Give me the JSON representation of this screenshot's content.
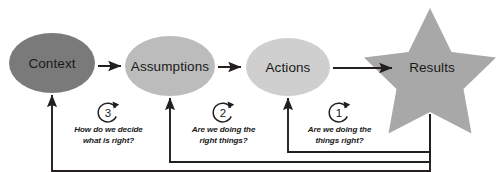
{
  "diagram": {
    "nodes": [
      {
        "id": "context",
        "label": "Context",
        "shape": "ellipse",
        "fill": "#7a7a7a"
      },
      {
        "id": "assumptions",
        "label": "Assumptions",
        "shape": "ellipse",
        "fill": "#bcbcbc"
      },
      {
        "id": "actions",
        "label": "Actions",
        "shape": "ellipse",
        "fill": "#cfcfcf"
      },
      {
        "id": "results",
        "label": "Results",
        "shape": "star",
        "fill": "#a8a8a8"
      }
    ],
    "flow_arrows": [
      {
        "from": "context",
        "to": "assumptions"
      },
      {
        "from": "assumptions",
        "to": "actions"
      },
      {
        "from": "actions",
        "to": "results"
      }
    ],
    "feedback_loops": [
      {
        "number": "1",
        "question_line1": "Are we doing the",
        "question_line2": "things right?",
        "from": "results",
        "to": "actions"
      },
      {
        "number": "2",
        "question_line1": "Are we doing the",
        "question_line2": "right things?",
        "from": "results",
        "to": "assumptions"
      },
      {
        "number": "3",
        "question_line1": "How do we decide",
        "question_line2": "what is right?",
        "from": "results",
        "to": "context"
      }
    ],
    "colors": {
      "line": "#231f20",
      "background": "#ffffff",
      "text": "#1a1a1a"
    }
  }
}
